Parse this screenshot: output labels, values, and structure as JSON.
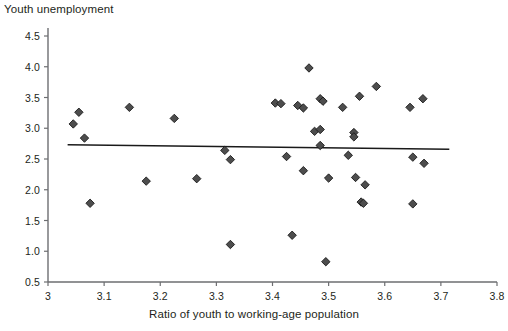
{
  "chart_data": {
    "type": "scatter",
    "title": "Youth unemployment",
    "xlabel": "Ratio of youth to working-age population",
    "ylabel": "Youth unemployment",
    "xlim": [
      3.0,
      3.8
    ],
    "ylim": [
      0.5,
      4.5
    ],
    "xticks": [
      "3",
      "3.1",
      "3.2",
      "3.3",
      "3.4",
      "3.5",
      "3.6",
      "3.7",
      "3.8"
    ],
    "xtick_values": [
      3.0,
      3.1,
      3.2,
      3.3,
      3.4,
      3.5,
      3.6,
      3.7,
      3.8
    ],
    "yticks": [
      "0.5",
      "1.0",
      "1.5",
      "2.0",
      "2.5",
      "3.0",
      "3.5",
      "4.0",
      "4.5"
    ],
    "ytick_values": [
      0.5,
      1.0,
      1.5,
      2.0,
      2.5,
      3.0,
      3.5,
      4.0,
      4.5
    ],
    "grid": false,
    "legend": false,
    "marker": "diamond",
    "marker_color": "#4d4d4d",
    "marker_edge_color": "#1a1a1a",
    "marker_size": 6,
    "points": [
      {
        "x": 3.045,
        "y": 3.07
      },
      {
        "x": 3.055,
        "y": 3.26
      },
      {
        "x": 3.065,
        "y": 2.84
      },
      {
        "x": 3.075,
        "y": 1.78
      },
      {
        "x": 3.145,
        "y": 3.34
      },
      {
        "x": 3.175,
        "y": 2.14
      },
      {
        "x": 3.225,
        "y": 3.16
      },
      {
        "x": 3.265,
        "y": 2.18
      },
      {
        "x": 3.315,
        "y": 2.64
      },
      {
        "x": 3.325,
        "y": 2.49
      },
      {
        "x": 3.325,
        "y": 1.11
      },
      {
        "x": 3.405,
        "y": 3.41
      },
      {
        "x": 3.415,
        "y": 3.4
      },
      {
        "x": 3.425,
        "y": 2.54
      },
      {
        "x": 3.435,
        "y": 1.26
      },
      {
        "x": 3.445,
        "y": 3.37
      },
      {
        "x": 3.455,
        "y": 3.33
      },
      {
        "x": 3.455,
        "y": 2.31
      },
      {
        "x": 3.465,
        "y": 3.98
      },
      {
        "x": 3.475,
        "y": 2.95
      },
      {
        "x": 3.485,
        "y": 2.98
      },
      {
        "x": 3.485,
        "y": 2.72
      },
      {
        "x": 3.485,
        "y": 3.48
      },
      {
        "x": 3.49,
        "y": 3.44
      },
      {
        "x": 3.495,
        "y": 0.83
      },
      {
        "x": 3.5,
        "y": 2.19
      },
      {
        "x": 3.525,
        "y": 3.34
      },
      {
        "x": 3.535,
        "y": 2.56
      },
      {
        "x": 3.545,
        "y": 2.93
      },
      {
        "x": 3.545,
        "y": 2.86
      },
      {
        "x": 3.548,
        "y": 2.2
      },
      {
        "x": 3.555,
        "y": 3.52
      },
      {
        "x": 3.558,
        "y": 1.8
      },
      {
        "x": 3.562,
        "y": 1.78
      },
      {
        "x": 3.565,
        "y": 2.08
      },
      {
        "x": 3.585,
        "y": 3.68
      },
      {
        "x": 3.645,
        "y": 3.34
      },
      {
        "x": 3.65,
        "y": 2.53
      },
      {
        "x": 3.65,
        "y": 1.77
      },
      {
        "x": 3.668,
        "y": 3.48
      },
      {
        "x": 3.67,
        "y": 2.43
      }
    ],
    "trendline": {
      "x1": 3.035,
      "y1": 2.73,
      "x2": 3.715,
      "y2": 2.66,
      "color": "#1a1a1a"
    }
  }
}
